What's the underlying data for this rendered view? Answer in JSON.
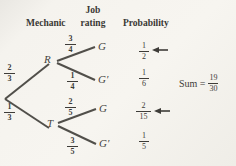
{
  "colors": {
    "paper": "#f5f3ee",
    "ink": "#3e3c38",
    "line": "#514f4a"
  },
  "headers": {
    "mechanic": "Mechanic",
    "job_line1": "Job",
    "job_line2": "rating",
    "probability": "Probability"
  },
  "tree": {
    "level1": [
      {
        "label": "R",
        "prob_num": "2",
        "prob_den": "3"
      },
      {
        "label": "T",
        "prob_num": "1",
        "prob_den": "3"
      }
    ],
    "level2": [
      {
        "label": "G",
        "prob_num": "3",
        "prob_den": "4"
      },
      {
        "label": "G′",
        "prob_num": "1",
        "prob_den": "4"
      },
      {
        "label": "G",
        "prob_num": "2",
        "prob_den": "5"
      },
      {
        "label": "G′",
        "prob_num": "3",
        "prob_den": "5"
      }
    ]
  },
  "probabilities": [
    {
      "num": "1",
      "den": "2",
      "arrow": true
    },
    {
      "num": "1",
      "den": "6",
      "arrow": false
    },
    {
      "num": "2",
      "den": "15",
      "arrow": true
    },
    {
      "num": "1",
      "den": "5",
      "arrow": false
    }
  ],
  "sum": {
    "label": "Sum =",
    "num": "19",
    "den": "30"
  }
}
